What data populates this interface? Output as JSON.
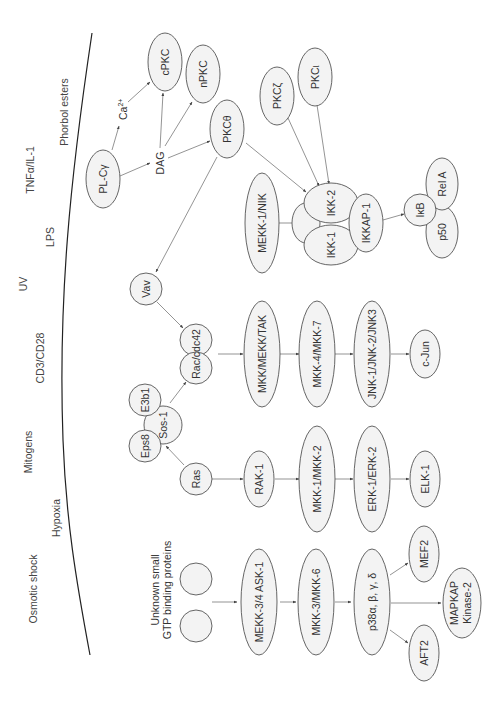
{
  "diagram": {
    "orientation": "rotated 90deg counter-clockwise (text reads bottom-to-top)",
    "colors": {
      "node_fill": "#f3f3f3",
      "node_stroke": "#555555",
      "edge": "#666666",
      "text": "#333333",
      "membrane": "#222222"
    },
    "stimuli": [
      {
        "id": "phorbol",
        "label": "Phorbol esters"
      },
      {
        "id": "tnf",
        "label": "TNFα/IL-1"
      },
      {
        "id": "lps",
        "label": "LPS"
      },
      {
        "id": "uv",
        "label": "UV"
      },
      {
        "id": "cd3",
        "label": "CD3/CD28"
      },
      {
        "id": "mitogens",
        "label": "Mitogens"
      },
      {
        "id": "hypoxia",
        "label": "Hypoxia"
      },
      {
        "id": "osmotic",
        "label": "Osmotic shock"
      }
    ],
    "free_labels": {
      "ca": "Ca",
      "ca_sup": "2+",
      "dag": "DAG",
      "unknown_line1": "Unknown small",
      "unknown_line2": "GTP binding proteins"
    },
    "nodes": {
      "plcg": "PL-Cγ",
      "cpkc": "cPKC",
      "npkc": "nPKC",
      "pkctheta": "PKCθ",
      "pkczeta": "PKCζ",
      "pkciota": "PKCι",
      "vav": "Vav",
      "mekk1nik": "MEKK-1/NIK",
      "ikk2": "IKK-2",
      "ikk1": "IKK-1",
      "ikkap1": "IKKAP-1",
      "ikb": "IκB",
      "rela": "Rel A",
      "p50": "p50",
      "eps8": "Eps8",
      "e3b1": "E3b1",
      "sos1": "Sos-1",
      "raccdc42": "Rac/cdc42",
      "ras": "Ras",
      "mkk_mekk_tak": "MKK/MEKK/TAK",
      "mkk4_mkk7": "MKK-4/MKK-7",
      "jnk": "JNK-1/JNK-2/JNK3",
      "cjun": "c-Jun",
      "rak1": "RAK-1",
      "mkk1_mkk2": "MKK-1/MKK-2",
      "erk": "ERK-1/ERK-2",
      "elk1": "ELK-1",
      "mekk34_ask1": "MEKK-3/4 ASK-1",
      "mkk3_mkk6": "MKK-3/MKK-6",
      "p38": "p38α, β, γ, δ",
      "mef2": "MEF2",
      "mapkap_line1": "MAPKAP",
      "mapkap_line2": "Kinase-2",
      "aft2": "AFT2",
      "gtp1": "",
      "gtp2": ""
    }
  }
}
